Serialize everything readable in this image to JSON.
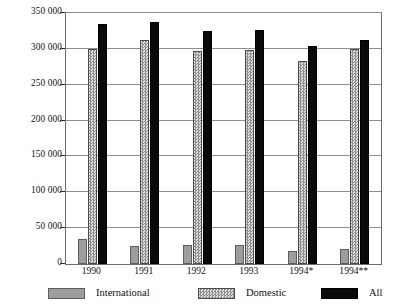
{
  "chart_data": {
    "type": "bar",
    "title": "",
    "subtitle": "",
    "xlabel": "",
    "ylabel": "",
    "categories": [
      "1990",
      "1991",
      "1992",
      "1993",
      "1994*",
      "1994**"
    ],
    "series": [
      {
        "name": "International",
        "color": "#9d9d9d",
        "pattern": "solid-light-gray",
        "values": [
          35000,
          25000,
          26000,
          26000,
          18000,
          21000
        ]
      },
      {
        "name": "Domestic",
        "color": "#b9b9b9",
        "pattern": "stippled-gray",
        "values": [
          300000,
          312000,
          297000,
          299000,
          283000,
          300000
        ]
      },
      {
        "name": "All",
        "color": "#0a0a0a",
        "pattern": "solid-black",
        "values": [
          335000,
          338000,
          325000,
          327000,
          304000,
          313000
        ]
      }
    ],
    "ylim": [
      0,
      350000
    ],
    "ytick_values": [
      0,
      50000,
      100000,
      150000,
      200000,
      250000,
      300000,
      350000
    ],
    "ytick_labels": [
      "0",
      "50 000",
      "100 000",
      "150 000",
      "200 000",
      "250 000",
      "300 000",
      "350 000"
    ],
    "grid": true,
    "grid_axis": "y",
    "legend_position": "bottom",
    "legend_entries": [
      "International",
      "Domestic",
      "All"
    ]
  }
}
